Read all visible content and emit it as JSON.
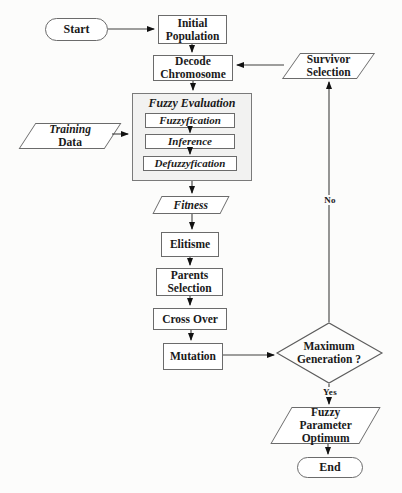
{
  "nodes": {
    "start": {
      "label": "Start",
      "shape": "terminator"
    },
    "initial_population": {
      "label": "Initial\nPopulation",
      "shape": "process"
    },
    "decode_chromosome": {
      "label": "Decode\nChromosome",
      "shape": "process"
    },
    "survivor_selection": {
      "label": "Survivor\nSelection",
      "shape": "parallelogram"
    },
    "fuzzy_evaluation": {
      "label": "Fuzzy Evaluation",
      "shape": "container"
    },
    "fuzzyfication": {
      "label": "Fuzzyfication",
      "shape": "process"
    },
    "inference": {
      "label": "Inference",
      "shape": "process"
    },
    "defuzzyfication": {
      "label": "Defuzzyfication",
      "shape": "process"
    },
    "training_data": {
      "line1": "Training",
      "line2": "Data",
      "shape": "parallelogram"
    },
    "fitness": {
      "label": "Fitness",
      "shape": "parallelogram"
    },
    "elitisme": {
      "label": "Elitisme",
      "shape": "process"
    },
    "parents_selection": {
      "label": "Parents\nSelection",
      "shape": "process"
    },
    "cross_over": {
      "label": "Cross Over",
      "shape": "process"
    },
    "mutation": {
      "label": "Mutation",
      "shape": "process"
    },
    "maximum_generation": {
      "label": "Maximum\nGeneration ?",
      "shape": "decision"
    },
    "fuzzy_parameter_optimum": {
      "label": "Fuzzy\nParameter\nOptimum",
      "shape": "parallelogram"
    },
    "end": {
      "label": "End",
      "shape": "terminator"
    }
  },
  "edge_labels": {
    "no": "No",
    "yes": "Yes"
  },
  "colors": {
    "background": "#fcfcfb",
    "line": "#3f3f3f",
    "arrowhead": "#111111",
    "node_border": "#6b6b6b",
    "node_fill": "#ffffff",
    "container_fill": "#f2f2f1",
    "text": "#1a1a1a"
  }
}
